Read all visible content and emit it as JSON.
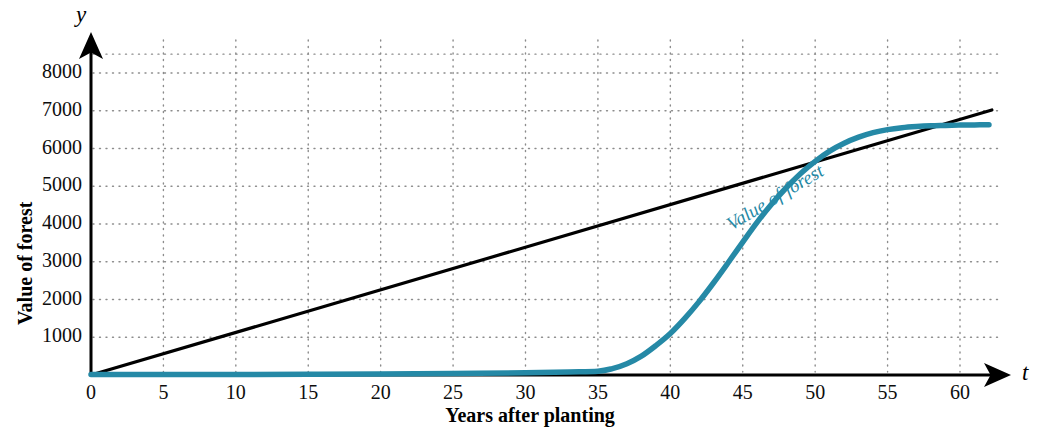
{
  "chart_data": {
    "type": "line",
    "title": "",
    "xlabel": "Years after planting",
    "ylabel": "Value of forest",
    "x_axis_variable": "t",
    "y_axis_variable": "y",
    "xlim": [
      0,
      63
    ],
    "ylim": [
      0,
      8600
    ],
    "grid": true,
    "grid_style": "dotted",
    "legend": "none",
    "xticks": [
      0,
      5,
      10,
      15,
      20,
      25,
      30,
      35,
      40,
      45,
      50,
      55,
      60
    ],
    "xtick_labels": [
      "0",
      "5",
      "10",
      "15",
      "20",
      "25",
      "30",
      "35",
      "40",
      "45",
      "50",
      "55",
      "60"
    ],
    "yticks": [
      1000,
      2000,
      3000,
      4000,
      5000,
      6000,
      7000,
      8000
    ],
    "ytick_labels": [
      "1000",
      "2000",
      "3000",
      "4000",
      "5000",
      "6000",
      "7000",
      "8000"
    ],
    "annotations": [
      {
        "text": "Value of forest",
        "x": 48,
        "y": 4300,
        "color": "#2589a6",
        "rotation": -31
      }
    ],
    "series": [
      {
        "name": "tangent-line",
        "kind": "line",
        "color": "#000000",
        "width": 3.2,
        "points": [
          [
            0,
            0
          ],
          [
            62.2,
            7020
          ]
        ]
      },
      {
        "name": "Value of forest",
        "kind": "curve",
        "color": "#2589a6",
        "width": 5.5,
        "points": [
          [
            0,
            10
          ],
          [
            5,
            12
          ],
          [
            10,
            15
          ],
          [
            15,
            20
          ],
          [
            20,
            28
          ],
          [
            25,
            40
          ],
          [
            30,
            60
          ],
          [
            33,
            80
          ],
          [
            35,
            100
          ],
          [
            36,
            170
          ],
          [
            37,
            300
          ],
          [
            38,
            500
          ],
          [
            39,
            780
          ],
          [
            40,
            1100
          ],
          [
            41,
            1500
          ],
          [
            42,
            1950
          ],
          [
            43,
            2450
          ],
          [
            44,
            2980
          ],
          [
            45,
            3520
          ],
          [
            46,
            4050
          ],
          [
            47,
            4530
          ],
          [
            48,
            4960
          ],
          [
            49,
            5340
          ],
          [
            50,
            5660
          ],
          [
            51,
            5930
          ],
          [
            52,
            6140
          ],
          [
            53,
            6300
          ],
          [
            54,
            6420
          ],
          [
            55,
            6500
          ],
          [
            56,
            6550
          ],
          [
            57,
            6580
          ],
          [
            58,
            6600
          ],
          [
            59,
            6610
          ],
          [
            60,
            6620
          ],
          [
            61,
            6625
          ],
          [
            62,
            6630
          ]
        ]
      }
    ]
  },
  "axes": {
    "y_variable_label": "y",
    "x_variable_label": "t",
    "y_title": "Value of forest",
    "x_title": "Years after planting"
  },
  "colors": {
    "curve": "#2589a6",
    "line": "#000000",
    "grid": "#8c8c8c",
    "axis": "#000000",
    "background": "#ffffff"
  }
}
